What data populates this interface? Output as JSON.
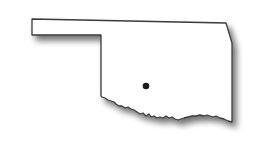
{
  "map": {
    "region": "Oklahoma",
    "fill_color": "#ffffff",
    "outline_color": "#3a3a3a",
    "shadow_color": "#9a9a9a",
    "marker": {
      "label": "location-marker",
      "color": "#1a1a1a",
      "x": 146,
      "y": 86
    }
  }
}
